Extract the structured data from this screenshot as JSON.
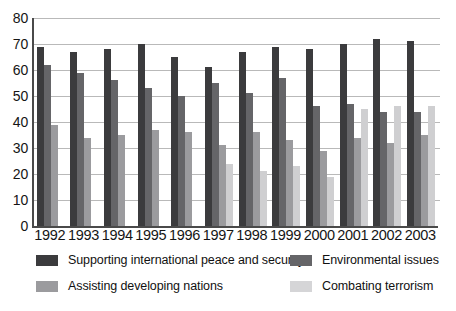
{
  "chart_data": {
    "type": "bar",
    "title": "",
    "xlabel": "",
    "ylabel": "",
    "ylim": [
      0,
      80
    ],
    "ytick_step": 10,
    "grid": true,
    "legend_position": "bottom",
    "categories": [
      "1992",
      "1993",
      "1994",
      "1995",
      "1996",
      "1997",
      "1998",
      "1999",
      "2000",
      "2001",
      "2002",
      "2003"
    ],
    "yticks": [
      "80",
      "70",
      "60",
      "50",
      "40",
      "30",
      "20",
      "10",
      "0"
    ],
    "series": [
      {
        "name": "Supporting international peace and security",
        "color": "#3b3b3d",
        "values": [
          69,
          67,
          68,
          70,
          65,
          61,
          67,
          69,
          68,
          70,
          72,
          71
        ]
      },
      {
        "name": "Environmental issues",
        "color": "#656568",
        "values": [
          62,
          59,
          56,
          53,
          50,
          55,
          51,
          57,
          46,
          47,
          44,
          44
        ]
      },
      {
        "name": "Assisting developing nations",
        "color": "#9b9b9e",
        "values": [
          39,
          34,
          35,
          37,
          36,
          31,
          36,
          33,
          29,
          34,
          32,
          35
        ]
      },
      {
        "name": "Combating terrorism",
        "color": "#cfcfd1",
        "values": [
          null,
          null,
          null,
          null,
          null,
          24,
          21,
          23,
          19,
          45,
          46,
          46
        ]
      }
    ]
  },
  "legend": {
    "items": [
      {
        "label": "Supporting international peace and security",
        "swatch": "#3b3b3d"
      },
      {
        "label": "Assisting developing nations",
        "swatch": "#9b9b9e"
      },
      {
        "label": "Environmental issues",
        "swatch": "#656568"
      },
      {
        "label": "Combating terrorism",
        "swatch": "#d5d5d7"
      }
    ]
  }
}
